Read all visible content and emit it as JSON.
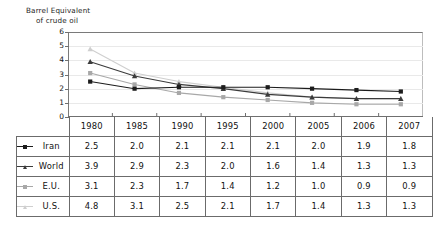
{
  "axis_title": {
    "line1": "Barrel Equivalent",
    "line2": "of crude oil"
  },
  "colors": {
    "iran": "#1c1c1c",
    "world": "#3b3b3b",
    "eu": "#a8a8a8",
    "us": "#cfcfcf",
    "grid": "#e9e9e9",
    "axis": "#6f6f6f",
    "table_border": "#6b6b6b",
    "text": "#111111"
  },
  "chart_data": {
    "type": "line",
    "title": "Barrel Equivalent of crude oil",
    "xlabel": "",
    "ylabel": "Barrel Equivalent of crude oil",
    "ylim": [
      0,
      6
    ],
    "yticks": [
      0,
      1,
      2,
      3,
      4,
      5,
      6
    ],
    "grid": true,
    "legend_position": "table-row-labels",
    "categories": [
      "1980",
      "1985",
      "1990",
      "1995",
      "2000",
      "2005",
      "2006",
      "2007"
    ],
    "series": [
      {
        "name": "Iran",
        "marker": "square",
        "color": "#1c1c1c",
        "values": [
          2.5,
          2.0,
          2.1,
          2.1,
          2.1,
          2.0,
          1.9,
          1.8
        ]
      },
      {
        "name": "World",
        "marker": "triangle",
        "color": "#3b3b3b",
        "values": [
          3.9,
          2.9,
          2.3,
          2.0,
          1.6,
          1.4,
          1.3,
          1.3
        ]
      },
      {
        "name": "E.U.",
        "marker": "square",
        "color": "#a8a8a8",
        "values": [
          3.1,
          2.3,
          1.7,
          1.4,
          1.2,
          1.0,
          0.9,
          0.9
        ]
      },
      {
        "name": "U.S.",
        "marker": "triangle",
        "color": "#cfcfcf",
        "values": [
          4.8,
          3.1,
          2.5,
          2.1,
          1.7,
          1.4,
          1.3,
          1.3
        ]
      }
    ]
  },
  "table": {
    "year_header": [
      "1980",
      "1985",
      "1990",
      "1995",
      "2000",
      "2005",
      "2006",
      "2007"
    ],
    "rows": [
      {
        "label": "Iran",
        "values": [
          "2.5",
          "2.0",
          "2.1",
          "2.1",
          "2.1",
          "2.0",
          "1.9",
          "1.8"
        ]
      },
      {
        "label": "World",
        "values": [
          "3.9",
          "2.9",
          "2.3",
          "2.0",
          "1.6",
          "1.4",
          "1.3",
          "1.3"
        ]
      },
      {
        "label": "E.U.",
        "values": [
          "3.1",
          "2.3",
          "1.7",
          "1.4",
          "1.2",
          "1.0",
          "0.9",
          "0.9"
        ]
      },
      {
        "label": "U.S.",
        "values": [
          "4.8",
          "3.1",
          "2.5",
          "2.1",
          "1.7",
          "1.4",
          "1.3",
          "1.3"
        ]
      }
    ]
  }
}
